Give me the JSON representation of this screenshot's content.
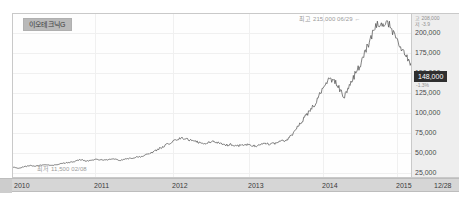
{
  "widget": {
    "type": "stock-price-chart",
    "ticker_label": "이오테크닉G"
  },
  "annotations": {
    "high": "최고 215,000 06/29",
    "high_arrow": "←",
    "low": "최저 11,500 02/08"
  },
  "price_axis": {
    "stats_line1": "고  208,000",
    "stats_line2": "저   -3.9",
    "current_price": "148,000",
    "current_change": "-1.3%",
    "ticks": [
      {
        "label": "200,000",
        "value": 200000
      },
      {
        "label": "175,000",
        "value": 175000
      },
      {
        "label": "150,000",
        "value": 150000
      },
      {
        "label": "125,000",
        "value": 125000
      },
      {
        "label": "100,000",
        "value": 100000
      },
      {
        "label": "75,000",
        "value": 75000
      },
      {
        "label": "50,000",
        "value": 50000
      },
      {
        "label": "25,000",
        "value": 25000
      }
    ]
  },
  "date_axis": {
    "ticks": [
      {
        "label": "2010",
        "x": 14
      },
      {
        "label": "2011",
        "x": 94
      },
      {
        "label": "2012",
        "x": 172
      },
      {
        "label": "2013",
        "x": 248
      },
      {
        "label": "2014",
        "x": 322
      },
      {
        "label": "2015",
        "x": 396
      },
      {
        "label": "12/28",
        "x": 436
      }
    ]
  },
  "colors": {
    "plot_background": "#fefefe",
    "axis_background": "#eeeeee",
    "date_axis_background": "#d6d6d6",
    "series_line": "#4a4a4a",
    "gridline": "#f0f0f0",
    "badge_background": "#b9b9b9",
    "price_highlight_background": "#2f2f2f"
  },
  "chart_data": {
    "type": "line",
    "title": "이오테크닉G",
    "xlabel": "",
    "ylabel": "",
    "grid": true,
    "legend": "none",
    "xlim": [
      "2010",
      "2015-12-28"
    ],
    "ylim": [
      0,
      215000
    ],
    "ytick_values": [
      25000,
      50000,
      75000,
      100000,
      125000,
      150000,
      175000,
      200000
    ],
    "xtick_labels": [
      "2010",
      "2011",
      "2012",
      "2013",
      "2014",
      "2015",
      "12/28"
    ],
    "annotations": [
      {
        "text": "최고 215,000 06/29",
        "x": "2015-06-29",
        "y": 215000
      },
      {
        "text": "최저 11,500 02/08",
        "x": "2010-02-08",
        "y": 11500
      }
    ],
    "series": [
      {
        "name": "이오테크닉G 주가",
        "x": [
          "2010-01",
          "2010-02",
          "2010-03",
          "2010-04",
          "2010-05",
          "2010-06",
          "2010-07",
          "2010-08",
          "2010-09",
          "2010-10",
          "2010-11",
          "2010-12",
          "2011-01",
          "2011-02",
          "2011-03",
          "2011-04",
          "2011-05",
          "2011-06",
          "2011-07",
          "2011-08",
          "2011-09",
          "2011-10",
          "2011-11",
          "2011-12",
          "2012-01",
          "2012-02",
          "2012-03",
          "2012-04",
          "2012-05",
          "2012-06",
          "2012-07",
          "2012-08",
          "2012-09",
          "2012-10",
          "2012-11",
          "2012-12",
          "2013-01",
          "2013-02",
          "2013-03",
          "2013-04",
          "2013-05",
          "2013-06",
          "2013-07",
          "2013-08",
          "2013-09",
          "2013-10",
          "2013-11",
          "2013-12",
          "2014-01",
          "2014-02",
          "2014-03",
          "2014-04",
          "2014-05",
          "2014-06",
          "2014-07",
          "2014-08",
          "2014-09",
          "2014-10",
          "2014-11",
          "2014-12",
          "2015-01",
          "2015-02",
          "2015-03",
          "2015-04",
          "2015-05",
          "2015-06",
          "2015-07",
          "2015-08",
          "2015-09",
          "2015-10",
          "2015-11",
          "2015-12"
        ],
        "values": [
          13000,
          11500,
          13500,
          15000,
          14500,
          15500,
          16000,
          15000,
          16500,
          18000,
          19000,
          20500,
          23000,
          21000,
          22000,
          23500,
          22500,
          23000,
          24000,
          22000,
          23500,
          25000,
          26000,
          27000,
          30000,
          33000,
          37000,
          41000,
          45000,
          48000,
          52000,
          50000,
          48000,
          46000,
          44000,
          45000,
          47000,
          44000,
          42000,
          43000,
          41000,
          42000,
          43000,
          41000,
          42000,
          44000,
          43000,
          45000,
          47000,
          50000,
          58000,
          68000,
          78000,
          88000,
          98000,
          112000,
          125000,
          130000,
          120000,
          105000,
          118000,
          135000,
          150000,
          168000,
          185000,
          205000,
          196000,
          202000,
          190000,
          172000,
          160000,
          150000
        ]
      }
    ]
  }
}
